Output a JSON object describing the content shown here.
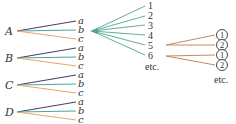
{
  "diagram": {
    "title": "",
    "left_tree": {
      "roots": [
        {
          "label": "A",
          "y": 31,
          "leaves": [
            {
              "label": "a",
              "y": 22
            },
            {
              "label": "b",
              "y": 31
            },
            {
              "label": "c",
              "y": 39
            }
          ]
        },
        {
          "label": "B",
          "y": 58,
          "leaves": [
            {
              "label": "a",
              "y": 49
            },
            {
              "label": "b",
              "y": 58
            },
            {
              "label": "c",
              "y": 67
            }
          ]
        },
        {
          "label": "C",
          "y": 85,
          "leaves": [
            {
              "label": "a",
              "y": 76
            },
            {
              "label": "b",
              "y": 85
            },
            {
              "label": "c",
              "y": 94
            }
          ]
        },
        {
          "label": "D",
          "y": 112,
          "leaves": [
            {
              "label": "a",
              "y": 103
            },
            {
              "label": "b",
              "y": 112
            },
            {
              "label": "c",
              "y": 121
            }
          ]
        }
      ]
    },
    "middle_fan": {
      "origin": "b",
      "items": [
        "1",
        "2",
        "3",
        "4",
        "5",
        "6"
      ],
      "more_label": "etc."
    },
    "right_tree": {
      "branches": [
        {
          "from": "5",
          "to": [
            "1",
            "2"
          ]
        },
        {
          "from": "6",
          "to": [
            "1",
            "2"
          ]
        }
      ],
      "more_label": "etc."
    },
    "colors": {
      "a_line": "#4a3f6b",
      "b_line": "#4fa596",
      "c_line": "#e8a56e",
      "fan_line": "#5fae9c",
      "right_line": "#c98662",
      "text": "#333333"
    }
  }
}
